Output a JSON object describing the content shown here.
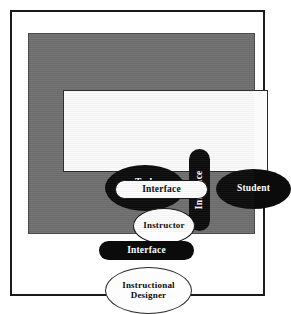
{
  "figure": {
    "background_color": "#ffffff",
    "frame_color": "#1a1a1a",
    "panel_color": "#6f6f6f",
    "inner_box_color": "#fbfbfb",
    "node_black": "#0b0b0b",
    "node_white": "#fdfdfd"
  },
  "nodes": {
    "task_environment": {
      "label": "Task\nEnvironment",
      "fill": "black",
      "shape": "ellipse"
    },
    "interface_vertical": {
      "label": "Interface",
      "fill": "black",
      "shape": "pill",
      "orientation": "vertical"
    },
    "student": {
      "label": "Student",
      "fill": "black",
      "shape": "ellipse"
    },
    "interface_middle": {
      "label": "Interface",
      "fill": "white",
      "shape": "pill",
      "orientation": "horizontal"
    },
    "instructor": {
      "label": "Instructor",
      "fill": "white",
      "shape": "ellipse"
    },
    "interface_bottom": {
      "label": "Interface",
      "fill": "black",
      "shape": "pill",
      "orientation": "horizontal"
    },
    "instructional_designer": {
      "label": "Instructional\nDesigner",
      "fill": "white",
      "shape": "ellipse"
    }
  }
}
